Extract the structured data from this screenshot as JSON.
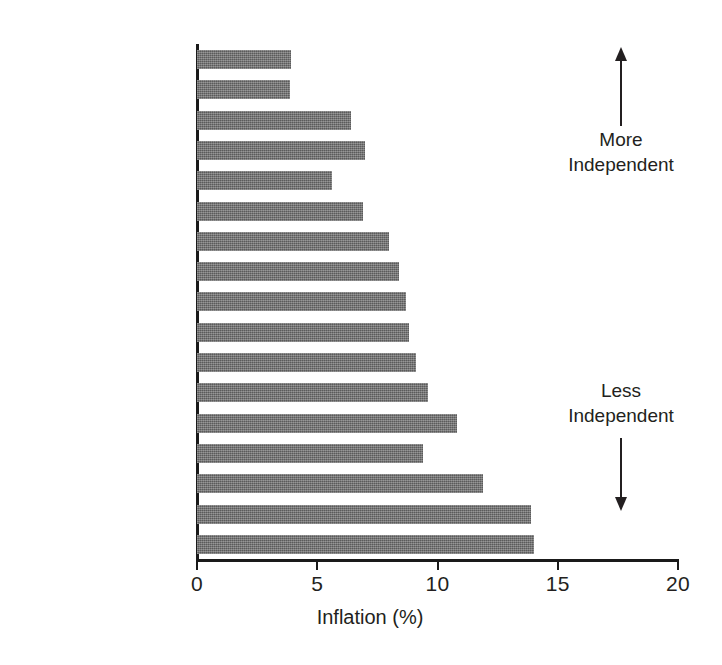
{
  "chart_data": {
    "type": "bar",
    "orientation": "horizontal",
    "title": "",
    "xlabel": "Inflation (%)",
    "ylabel": "",
    "xlim": [
      0,
      20
    ],
    "xticks": [
      0,
      5,
      10,
      15,
      20
    ],
    "xtick_labels": [
      "0",
      "5",
      "10",
      "15",
      "20"
    ],
    "grid": false,
    "legend": null,
    "bar_color": "#6f6f6f",
    "categories": [
      "Switzerland",
      "Germany",
      "Japan",
      "United States",
      "Netherlands",
      "Belgium",
      "Canada",
      "Norway",
      "Sweden",
      "Denmark",
      "France",
      "Finland",
      "United Kingdom",
      "Australia",
      "New Zealand",
      "Spain",
      "Italy"
    ],
    "values": [
      3.9,
      3.85,
      6.4,
      7.0,
      5.6,
      6.9,
      8.0,
      8.4,
      8.7,
      8.8,
      9.1,
      9.6,
      10.8,
      9.4,
      11.9,
      13.9,
      14.0
    ],
    "annotations": [
      {
        "text": "More\nIndependent",
        "line1": "More",
        "line2": "Independent",
        "arrow": "up"
      },
      {
        "text": "Less\nIndependent",
        "line1": "Less",
        "line2": "Independent",
        "arrow": "down"
      }
    ]
  },
  "axis": {
    "x_title": "Inflation (%)",
    "ticks": [
      "0",
      "5",
      "10",
      "15",
      "20"
    ]
  },
  "annotations": {
    "more": {
      "line1": "More",
      "line2": "Independent"
    },
    "less": {
      "line1": "Less",
      "line2": "Independent"
    }
  }
}
